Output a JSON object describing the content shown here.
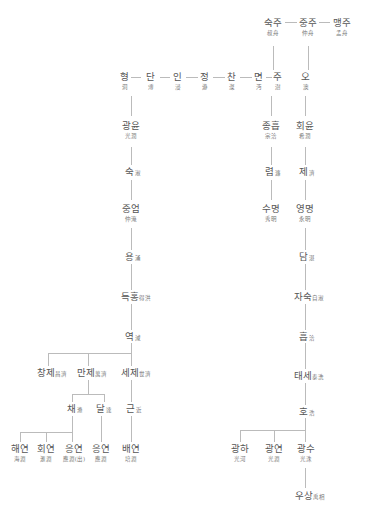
{
  "line_color": "#bbbbbb",
  "nodes": {
    "sukju": {
      "kr": "숙주",
      "hj": "叔舟"
    },
    "jungju": {
      "kr": "중주",
      "hj": "仲舟"
    },
    "maengju": {
      "kr": "맹주",
      "hj": "孟舟"
    },
    "hyeong": {
      "kr": "형",
      "hj": "洞"
    },
    "dan": {
      "kr": "단",
      "hj": "溥"
    },
    "in": {
      "kr": "인",
      "hj": "浸"
    },
    "jeong": {
      "kr": "정",
      "hj": "瀞"
    },
    "chan": {
      "kr": "찬",
      "hj": "澯"
    },
    "myeon": {
      "kr": "면",
      "hj": "沔"
    },
    "ju": {
      "kr": "주",
      "hj": "澍"
    },
    "o": {
      "kr": "오",
      "hj": "澳"
    },
    "gwangyun": {
      "kr": "광윤",
      "hj": "光潤"
    },
    "suk": {
      "kr": "숙",
      "hj": "淑"
    },
    "jungeom": {
      "kr": "중엄",
      "hj": "仲淹"
    },
    "yong": {
      "kr": "용",
      "hj": "涌"
    },
    "deukhong": {
      "kr": "득홍",
      "hj": "得洪"
    },
    "yeok": {
      "kr": "역",
      "hj": "淢"
    },
    "changje": {
      "kr": "창제",
      "hj": "昌濟"
    },
    "manje": {
      "kr": "만제",
      "hj": "萬濟"
    },
    "seje": {
      "kr": "세제",
      "hj": "世濟"
    },
    "chae": {
      "kr": "채",
      "hj": "滌"
    },
    "dal": {
      "kr": "달",
      "hj": "達"
    },
    "geun": {
      "kr": "근",
      "hj": "近"
    },
    "haeyeon": {
      "kr": "해연",
      "hj": "海淵"
    },
    "hoeyeon": {
      "kr": "회연",
      "hj": "滙淵"
    },
    "eungyeon1": {
      "kr": "응연",
      "hj": "應淵(出)"
    },
    "eungyeon2": {
      "kr": "응연",
      "hj": "應淵"
    },
    "baeyeon": {
      "kr": "배연",
      "hj": "培淵"
    },
    "jongheup": {
      "kr": "종흡",
      "hj": "宗洽"
    },
    "ryeom": {
      "kr": "렴",
      "hj": "濂"
    },
    "sumyeong": {
      "kr": "수명",
      "hj": "秀明"
    },
    "hoeyun": {
      "kr": "회윤",
      "hj": "希潤"
    },
    "je": {
      "kr": "제",
      "hj": "濟"
    },
    "yeongmyeong": {
      "kr": "영명",
      "hj": "永明"
    },
    "dam": {
      "kr": "담",
      "hj": "湛"
    },
    "jasuk": {
      "kr": "자숙",
      "hj": "自淑"
    },
    "heup": {
      "kr": "흡",
      "hj": "洽"
    },
    "taese": {
      "kr": "태세",
      "hj": "泰洗"
    },
    "ho": {
      "kr": "호",
      "hj": "浩"
    },
    "gwangha": {
      "kr": "광하",
      "hj": "光河"
    },
    "gwangyeon": {
      "kr": "광연",
      "hj": "光淵"
    },
    "gwangsu": {
      "kr": "광수",
      "hj": "光洙"
    },
    "usang": {
      "kr": "우상",
      "hj": "禹相"
    }
  }
}
